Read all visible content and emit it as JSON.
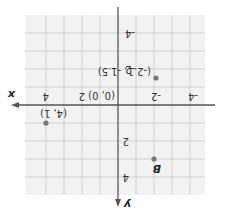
{
  "diagram": {
    "type": "coordinate-plane",
    "rotation_deg": 180,
    "axes": {
      "x_label": "x",
      "y_label": "y",
      "x_range": [
        -5,
        5
      ],
      "y_range": [
        -5,
        5
      ],
      "tick_labels_x": [
        "-4",
        "-2",
        "2",
        "4"
      ],
      "tick_labels_y": [
        "-4",
        "-2",
        "2",
        "4"
      ],
      "grid": true,
      "grid_step": 1
    },
    "origin_label": "(0, 0)",
    "points": [
      {
        "name": "",
        "label": "(4, 1)",
        "x": 4,
        "y": 1
      },
      {
        "name": "",
        "label": "(-2.1, -1.5)",
        "x": -2.1,
        "y": -1.5
      },
      {
        "name": "B",
        "label": "B",
        "x": -2,
        "y": 3
      }
    ],
    "colors": {
      "grid": "#c8c8c8",
      "background": "#f2f2f2",
      "axis": "#555555",
      "point": "#777777"
    }
  }
}
